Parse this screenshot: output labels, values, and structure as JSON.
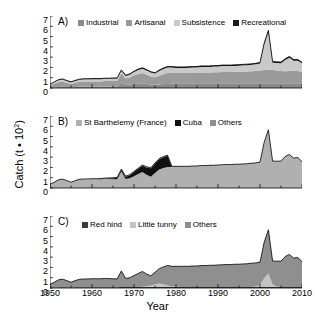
{
  "figure": {
    "axis": {
      "ylabel_text": "Catch (t • 10",
      "ylabel_exp": "2",
      "ylabel_close": ")",
      "xlabel": "Year",
      "yticks": [
        "7",
        "6",
        "5",
        "4",
        "3",
        "2",
        "1",
        "0"
      ],
      "xticks": [
        "1950",
        "1960",
        "1970",
        "1980",
        "1990",
        "2000",
        "2010"
      ]
    },
    "panels": [
      {
        "letter": "A)",
        "legend": [
          {
            "label": "Industrial",
            "color": "#8a8a8a"
          },
          {
            "label": "Artisanal",
            "color": "#9a9a9a"
          },
          {
            "label": "Subsistence",
            "color": "#c9c9c9"
          },
          {
            "label": "Recreational",
            "color": "#1a1a1a"
          }
        ]
      },
      {
        "letter": "B)",
        "legend": [
          {
            "label": "St Barthelemy (France)",
            "color": "#b0b0b0"
          },
          {
            "label": "Cuba",
            "color": "#101010"
          },
          {
            "label": "Others",
            "color": "#8f8f8f"
          }
        ]
      },
      {
        "letter": "C)",
        "legend": [
          {
            "label": "Red hind",
            "color": "#3a3a3a"
          },
          {
            "label": "Little tunny",
            "color": "#c4c4c4"
          },
          {
            "label": "Others",
            "color": "#8f8f8f"
          }
        ]
      }
    ]
  },
  "chart_data": [
    {
      "type": "area",
      "title": "A) Catch by sector",
      "xlabel": "Year",
      "ylabel": "Catch (t · 10^2)",
      "xlim": [
        1950,
        2010
      ],
      "ylim": [
        0,
        7
      ],
      "grid": false,
      "legend_position": "top",
      "stacked": true,
      "x": [
        1950,
        1951,
        1952,
        1953,
        1954,
        1955,
        1956,
        1957,
        1958,
        1959,
        1960,
        1961,
        1962,
        1963,
        1964,
        1965,
        1966,
        1967,
        1968,
        1969,
        1970,
        1971,
        1972,
        1973,
        1974,
        1975,
        1976,
        1977,
        1978,
        1979,
        1980,
        1981,
        1982,
        1983,
        1984,
        1985,
        1986,
        1987,
        1988,
        1989,
        1990,
        1991,
        1992,
        1993,
        1994,
        1995,
        1996,
        1997,
        1998,
        1999,
        2000,
        2001,
        2002,
        2003,
        2004,
        2005,
        2006,
        2007,
        2008,
        2009,
        2010
      ],
      "series": [
        {
          "name": "Industrial",
          "color": "#8a8a8a",
          "values": [
            0.0,
            0.05,
            0.1,
            0.12,
            0.1,
            0.08,
            0.1,
            0.12,
            0.12,
            0.12,
            0.12,
            0.12,
            0.12,
            0.12,
            0.12,
            0.12,
            0.12,
            0.55,
            0.3,
            0.32,
            0.38,
            0.42,
            0.45,
            0.4,
            0.35,
            0.32,
            0.35,
            0.38,
            0.4,
            0.42,
            0.45,
            0.45,
            0.45,
            0.45,
            0.45,
            0.45,
            0.45,
            0.45,
            0.45,
            0.45,
            0.45,
            0.45,
            0.45,
            0.45,
            0.45,
            0.45,
            0.45,
            0.45,
            0.45,
            0.45,
            0.45,
            0.45,
            0.45,
            0.45,
            0.45,
            0.45,
            0.45,
            0.45,
            0.45,
            0.45,
            0.45
          ]
        },
        {
          "name": "Artisanal",
          "color": "#9a9a9a",
          "values": [
            0.3,
            0.38,
            0.45,
            0.48,
            0.4,
            0.32,
            0.4,
            0.48,
            0.5,
            0.5,
            0.52,
            0.52,
            0.52,
            0.55,
            0.55,
            0.58,
            0.58,
            0.85,
            0.62,
            0.7,
            0.85,
            0.95,
            1.0,
            0.9,
            0.78,
            0.72,
            0.85,
            0.95,
            1.05,
            1.05,
            1.0,
            1.0,
            1.0,
            1.0,
            1.02,
            1.02,
            1.05,
            1.05,
            1.05,
            1.08,
            1.08,
            1.1,
            1.1,
            1.1,
            1.12,
            1.12,
            1.15,
            1.15,
            1.18,
            1.2,
            1.25,
            1.3,
            1.35,
            1.3,
            1.25,
            1.2,
            1.18,
            1.2,
            1.25,
            1.2,
            1.1
          ]
        },
        {
          "name": "Subsistence",
          "color": "#c9c9c9",
          "values": [
            0.05,
            0.12,
            0.2,
            0.22,
            0.18,
            0.15,
            0.18,
            0.2,
            0.22,
            0.22,
            0.22,
            0.22,
            0.22,
            0.22,
            0.22,
            0.22,
            0.22,
            0.28,
            0.25,
            0.28,
            0.32,
            0.38,
            0.42,
            0.4,
            0.38,
            0.36,
            0.45,
            0.52,
            0.55,
            0.52,
            0.5,
            0.5,
            0.5,
            0.52,
            0.52,
            0.52,
            0.55,
            0.55,
            0.55,
            0.55,
            0.55,
            0.58,
            0.58,
            0.58,
            0.58,
            0.6,
            0.6,
            0.62,
            0.62,
            0.65,
            0.68,
            2.5,
            3.65,
            0.7,
            0.72,
            0.75,
            1.1,
            1.3,
            0.95,
            1.0,
            0.85
          ]
        },
        {
          "name": "Recreational",
          "color": "#1a1a1a",
          "values": [
            0.02,
            0.04,
            0.06,
            0.06,
            0.05,
            0.05,
            0.06,
            0.06,
            0.06,
            0.06,
            0.06,
            0.06,
            0.06,
            0.06,
            0.06,
            0.06,
            0.06,
            0.08,
            0.07,
            0.07,
            0.08,
            0.09,
            0.1,
            0.09,
            0.08,
            0.08,
            0.09,
            0.1,
            0.1,
            0.1,
            0.1,
            0.1,
            0.1,
            0.1,
            0.1,
            0.1,
            0.1,
            0.1,
            0.1,
            0.1,
            0.1,
            0.1,
            0.1,
            0.1,
            0.1,
            0.1,
            0.1,
            0.1,
            0.1,
            0.1,
            0.1,
            0.12,
            0.15,
            0.12,
            0.12,
            0.12,
            0.12,
            0.12,
            0.12,
            0.12,
            0.1
          ]
        }
      ]
    },
    {
      "type": "area",
      "title": "B) Catch by fishing country",
      "xlabel": "Year",
      "ylabel": "Catch (t · 10^2)",
      "xlim": [
        1950,
        2010
      ],
      "ylim": [
        0,
        7
      ],
      "grid": false,
      "legend_position": "top",
      "stacked": true,
      "x": [
        1950,
        1951,
        1952,
        1953,
        1954,
        1955,
        1956,
        1957,
        1958,
        1959,
        1960,
        1961,
        1962,
        1963,
        1964,
        1965,
        1966,
        1967,
        1968,
        1969,
        1970,
        1971,
        1972,
        1973,
        1974,
        1975,
        1976,
        1977,
        1978,
        1979,
        1980,
        1981,
        1982,
        1983,
        1984,
        1985,
        1986,
        1987,
        1988,
        1989,
        1990,
        1991,
        1992,
        1993,
        1994,
        1995,
        1996,
        1997,
        1998,
        1999,
        2000,
        2001,
        2002,
        2003,
        2004,
        2005,
        2006,
        2007,
        2008,
        2009,
        2010
      ],
      "series": [
        {
          "name": "St Barthelemy (France)",
          "color": "#b0b0b0",
          "values": [
            0.35,
            0.52,
            0.75,
            0.82,
            0.68,
            0.52,
            0.68,
            0.8,
            0.84,
            0.84,
            0.86,
            0.86,
            0.86,
            0.88,
            0.88,
            0.85,
            0.85,
            1.6,
            0.88,
            0.95,
            1.15,
            1.35,
            1.55,
            1.3,
            1.1,
            1.45,
            1.8,
            1.95,
            2.05,
            2.05,
            2.05,
            2.05,
            2.05,
            2.05,
            2.08,
            2.08,
            2.12,
            2.12,
            2.15,
            2.15,
            2.18,
            2.2,
            2.22,
            2.22,
            2.25,
            2.25,
            2.28,
            2.3,
            2.35,
            2.38,
            2.45,
            4.4,
            5.6,
            2.55,
            2.55,
            2.55,
            3.0,
            3.2,
            2.85,
            2.9,
            2.5
          ]
        },
        {
          "name": "Cuba",
          "color": "#101010",
          "values": [
            0.0,
            0.0,
            0.0,
            0.0,
            0.0,
            0.0,
            0.0,
            0.0,
            0.0,
            0.0,
            0.0,
            0.0,
            0.02,
            0.04,
            0.06,
            0.1,
            0.14,
            0.18,
            0.22,
            0.3,
            0.4,
            0.52,
            0.62,
            0.7,
            0.82,
            0.92,
            1.0,
            1.05,
            1.08,
            0.0,
            0.0,
            0.0,
            0.0,
            0.0,
            0.0,
            0.0,
            0.0,
            0.0,
            0.0,
            0.0,
            0.0,
            0.0,
            0.0,
            0.0,
            0.0,
            0.0,
            0.0,
            0.0,
            0.0,
            0.0,
            0.0,
            0.0,
            0.0,
            0.0,
            0.0,
            0.0,
            0.0,
            0.0,
            0.0,
            0.0,
            0.0
          ]
        },
        {
          "name": "Others",
          "color": "#8f8f8f",
          "values": [
            0.02,
            0.03,
            0.04,
            0.04,
            0.04,
            0.04,
            0.04,
            0.04,
            0.04,
            0.04,
            0.04,
            0.04,
            0.04,
            0.04,
            0.04,
            0.04,
            0.04,
            0.06,
            0.05,
            0.05,
            0.06,
            0.06,
            0.06,
            0.06,
            0.06,
            0.06,
            0.06,
            0.06,
            0.06,
            0.06,
            0.06,
            0.06,
            0.06,
            0.06,
            0.06,
            0.06,
            0.06,
            0.06,
            0.06,
            0.06,
            0.06,
            0.06,
            0.06,
            0.06,
            0.06,
            0.06,
            0.06,
            0.06,
            0.06,
            0.06,
            0.06,
            0.06,
            0.06,
            0.06,
            0.06,
            0.06,
            0.06,
            0.06,
            0.06,
            0.06,
            0.06
          ]
        }
      ]
    },
    {
      "type": "area",
      "title": "C) Catch by taxon",
      "xlabel": "Year",
      "ylabel": "Catch (t · 10^2)",
      "xlim": [
        1950,
        2010
      ],
      "ylim": [
        0,
        7
      ],
      "grid": false,
      "legend_position": "top",
      "stacked": true,
      "x": [
        1950,
        1951,
        1952,
        1953,
        1954,
        1955,
        1956,
        1957,
        1958,
        1959,
        1960,
        1961,
        1962,
        1963,
        1964,
        1965,
        1966,
        1967,
        1968,
        1969,
        1970,
        1971,
        1972,
        1973,
        1974,
        1975,
        1976,
        1977,
        1978,
        1979,
        1980,
        1981,
        1982,
        1983,
        1984,
        1985,
        1986,
        1987,
        1988,
        1989,
        1990,
        1991,
        1992,
        1993,
        1994,
        1995,
        1996,
        1997,
        1998,
        1999,
        2000,
        2001,
        2002,
        2003,
        2004,
        2005,
        2006,
        2007,
        2008,
        2009,
        2010
      ],
      "series": [
        {
          "name": "Red hind",
          "color": "#3a3a3a",
          "values": [
            0.04,
            0.06,
            0.08,
            0.08,
            0.07,
            0.06,
            0.07,
            0.08,
            0.08,
            0.08,
            0.08,
            0.08,
            0.08,
            0.08,
            0.08,
            0.08,
            0.08,
            0.1,
            0.09,
            0.09,
            0.1,
            0.1,
            0.1,
            0.1,
            0.1,
            0.1,
            0.1,
            0.1,
            0.1,
            0.1,
            0.1,
            0.1,
            0.1,
            0.1,
            0.1,
            0.1,
            0.1,
            0.1,
            0.1,
            0.1,
            0.1,
            0.1,
            0.1,
            0.1,
            0.1,
            0.1,
            0.1,
            0.1,
            0.1,
            0.1,
            0.1,
            0.1,
            0.1,
            0.1,
            0.1,
            0.1,
            0.1,
            0.1,
            0.1,
            0.1,
            0.1
          ]
        },
        {
          "name": "Little tunny",
          "color": "#c4c4c4",
          "values": [
            0.0,
            0.0,
            0.0,
            0.0,
            0.0,
            0.0,
            0.0,
            0.0,
            0.0,
            0.0,
            0.0,
            0.0,
            0.0,
            0.0,
            0.0,
            0.0,
            0.0,
            0.0,
            0.0,
            0.0,
            0.0,
            0.0,
            0.02,
            0.06,
            0.14,
            0.26,
            0.34,
            0.26,
            0.14,
            0.05,
            0.02,
            0.0,
            0.0,
            0.0,
            0.0,
            0.0,
            0.0,
            0.0,
            0.0,
            0.0,
            0.0,
            0.0,
            0.0,
            0.0,
            0.0,
            0.0,
            0.0,
            0.0,
            0.0,
            0.05,
            0.2,
            0.85,
            1.3,
            0.25,
            0.05,
            0.0,
            0.0,
            0.0,
            0.0,
            0.0,
            0.0
          ]
        },
        {
          "name": "Others",
          "color": "#8f8f8f",
          "values": [
            0.33,
            0.49,
            0.71,
            0.78,
            0.65,
            0.5,
            0.65,
            0.76,
            0.8,
            0.8,
            0.82,
            0.82,
            0.82,
            0.84,
            0.84,
            0.81,
            0.81,
            1.56,
            0.84,
            0.91,
            1.11,
            1.31,
            1.49,
            1.2,
            0.94,
            1.17,
            1.44,
            1.69,
            1.95,
            1.96,
            1.99,
            2.01,
            2.01,
            2.01,
            2.04,
            2.04,
            2.08,
            2.08,
            2.11,
            2.11,
            2.14,
            2.16,
            2.18,
            2.18,
            2.21,
            2.21,
            2.24,
            2.26,
            2.31,
            2.29,
            2.21,
            3.51,
            4.26,
            2.26,
            2.46,
            2.51,
            2.96,
            3.16,
            2.81,
            2.86,
            2.46
          ]
        }
      ]
    }
  ]
}
